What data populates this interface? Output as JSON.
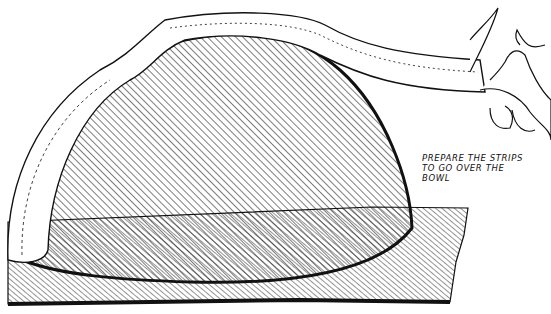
{
  "illustration": {
    "caption": "PREPARE THE STRIPS\nTO GO OVER THE\nBOWL",
    "subject": "hand laying a rolled clay strip over an upturned bowl on a hatched board",
    "colors": {
      "ink": "#111111",
      "paper": "#ffffff"
    }
  }
}
